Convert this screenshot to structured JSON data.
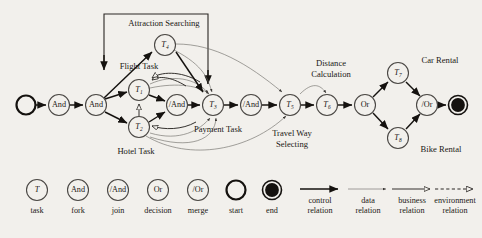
{
  "figure": {
    "background_color": "#f2f0ec",
    "ink_color": "#1b1815"
  },
  "nodes": [
    {
      "id": "start",
      "type": "start",
      "label": "",
      "x": 26,
      "y": 105,
      "r": 9.5
    },
    {
      "id": "and1",
      "type": "fork",
      "label": "And",
      "x": 59,
      "y": 105,
      "r": 10.5
    },
    {
      "id": "and2",
      "type": "fork",
      "label": "And",
      "x": 96,
      "y": 105,
      "r": 10.5
    },
    {
      "id": "t4",
      "type": "task",
      "label": "T",
      "sub": "4",
      "x": 165,
      "y": 45,
      "r": 10.5
    },
    {
      "id": "t1",
      "type": "task",
      "label": "T",
      "sub": "1",
      "x": 139,
      "y": 90,
      "r": 10.5
    },
    {
      "id": "t2",
      "type": "task",
      "label": "T",
      "sub": "2",
      "x": 139,
      "y": 127,
      "r": 10.5
    },
    {
      "id": "join1",
      "type": "join",
      "label": "/And",
      "x": 177,
      "y": 105,
      "r": 10.5
    },
    {
      "id": "t3",
      "type": "task",
      "label": "T",
      "sub": "3",
      "x": 213,
      "y": 105,
      "r": 10.5
    },
    {
      "id": "join2",
      "type": "join",
      "label": "/And",
      "x": 251,
      "y": 105,
      "r": 10.5
    },
    {
      "id": "t5",
      "type": "task",
      "label": "T",
      "sub": "5",
      "x": 290,
      "y": 105,
      "r": 10.5
    },
    {
      "id": "t6",
      "type": "task",
      "label": "T",
      "sub": "6",
      "x": 327,
      "y": 105,
      "r": 10.5
    },
    {
      "id": "or1",
      "type": "decision",
      "label": "Or",
      "x": 365,
      "y": 105,
      "r": 10.5
    },
    {
      "id": "t7",
      "type": "task",
      "label": "T",
      "sub": "7",
      "x": 398,
      "y": 73,
      "r": 10.5
    },
    {
      "id": "t8",
      "type": "task",
      "label": "T",
      "sub": "8",
      "x": 398,
      "y": 138,
      "r": 10.5
    },
    {
      "id": "or2",
      "type": "merge",
      "label": "/Or",
      "x": 427,
      "y": 105,
      "r": 10.5
    },
    {
      "id": "end",
      "type": "end",
      "label": "",
      "x": 458,
      "y": 105,
      "r": 9.5
    }
  ],
  "annotations": [
    {
      "id": "ann-attraction",
      "text": "Attraction Searching",
      "x": 164,
      "y": 26
    },
    {
      "id": "ann-flight",
      "text": "Flight Task",
      "x": 139,
      "y": 69
    },
    {
      "id": "ann-hotel",
      "text": "Hotel Task",
      "x": 136,
      "y": 154
    },
    {
      "id": "ann-payment",
      "text": "Payment Task",
      "x": 218,
      "y": 132
    },
    {
      "id": "ann-distance-1",
      "text": "Distance",
      "x": 331,
      "y": 66
    },
    {
      "id": "ann-distance-2",
      "text": "Calculation",
      "x": 331,
      "y": 77
    },
    {
      "id": "ann-travelway-1",
      "text": "Travel Way",
      "x": 292,
      "y": 136
    },
    {
      "id": "ann-travelway-2",
      "text": "Selecting",
      "x": 292,
      "y": 147
    },
    {
      "id": "ann-carrental",
      "text": "Car Rental",
      "x": 440,
      "y": 63
    },
    {
      "id": "ann-bikerental",
      "text": "Bike Rental",
      "x": 441,
      "y": 152
    }
  ],
  "legend": {
    "symbols": [
      {
        "id": "leg-task",
        "label": "T",
        "sub": "",
        "caption": "task",
        "x": 37,
        "y": 190,
        "kind": "task"
      },
      {
        "id": "leg-fork",
        "label": "And",
        "caption": "fork",
        "x": 78,
        "y": 190,
        "kind": "node"
      },
      {
        "id": "leg-join",
        "label": "/And",
        "caption": "join",
        "x": 118,
        "y": 190,
        "kind": "node"
      },
      {
        "id": "leg-decision",
        "label": "Or",
        "caption": "decision",
        "x": 158,
        "y": 190,
        "kind": "node"
      },
      {
        "id": "leg-merge",
        "label": "/Or",
        "caption": "merge",
        "x": 198,
        "y": 190,
        "kind": "node"
      },
      {
        "id": "leg-start",
        "label": "",
        "caption": "start",
        "x": 236,
        "y": 190,
        "kind": "start"
      },
      {
        "id": "leg-end",
        "label": "",
        "caption": "end",
        "x": 272,
        "y": 190,
        "kind": "end"
      }
    ],
    "relations": [
      {
        "id": "leg-control",
        "caption_1": "control",
        "caption_2": "relation",
        "x": 320,
        "y": 190,
        "kind": "control"
      },
      {
        "id": "leg-data",
        "caption_1": "data",
        "caption_2": "relation",
        "x": 368,
        "y": 190,
        "kind": "data"
      },
      {
        "id": "leg-business",
        "caption_1": "business",
        "caption_2": "relation",
        "x": 412,
        "y": 190,
        "kind": "business"
      },
      {
        "id": "leg-environment",
        "caption_1": "environment",
        "caption_2": "relation",
        "x": 455,
        "y": 190,
        "kind": "environment"
      }
    ]
  },
  "relation_types": {
    "control": "control relation",
    "data": "data relation",
    "business": "business relation",
    "environment": "environment relation"
  }
}
